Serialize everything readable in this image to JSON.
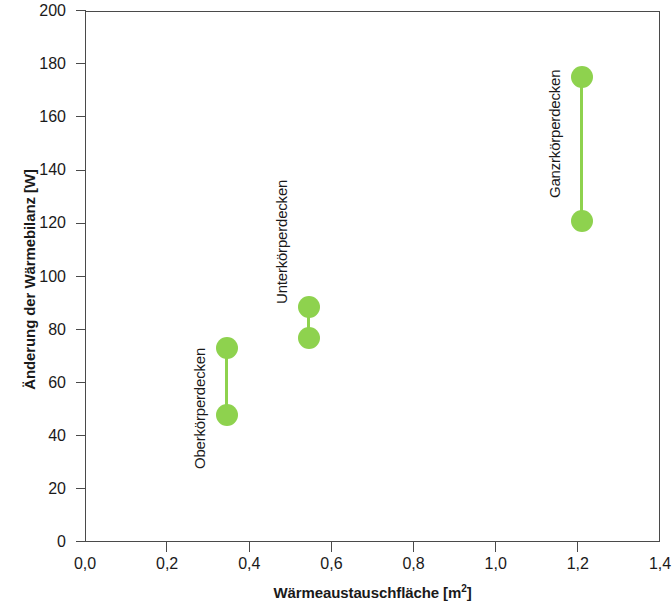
{
  "chart_data": {
    "type": "scatter",
    "title": "",
    "xlabel": "Wärmeaustauschfläche [m²]",
    "ylabel": "Änderung der Wärmebilanz [W]",
    "xlim": [
      0.0,
      1.4
    ],
    "ylim": [
      0,
      200
    ],
    "grid": false,
    "legend": "none",
    "xticks": [
      "0,0",
      "0,2",
      "0,4",
      "0,6",
      "0,8",
      "1,0",
      "1,2",
      "1,4"
    ],
    "xtick_values": [
      0.0,
      0.2,
      0.4,
      0.6,
      0.8,
      1.0,
      1.2,
      1.4
    ],
    "yticks": [
      "0",
      "20",
      "40",
      "60",
      "80",
      "100",
      "120",
      "140",
      "160",
      "180",
      "200"
    ],
    "ytick_values": [
      0,
      20,
      40,
      60,
      80,
      100,
      120,
      140,
      160,
      180,
      200
    ],
    "marker_color": "#8ED24E",
    "line_color": "#8ED24E",
    "series": [
      {
        "name": "Oberkörperdecken",
        "x": 0.345,
        "values": [
          73,
          48
        ],
        "label_x": 0.345,
        "label_y_bottom": 34
      },
      {
        "name": "Unterkörperdecken",
        "x": 0.545,
        "values": [
          88.5,
          77
        ],
        "label_x": 0.545,
        "label_y_bottom": 96
      },
      {
        "name": "Ganzrkörperdecken",
        "x": 1.21,
        "values": [
          175,
          121
        ],
        "label_x": 1.21,
        "label_y_bottom": 136
      }
    ]
  }
}
